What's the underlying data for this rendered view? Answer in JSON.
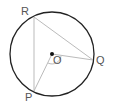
{
  "diagram": {
    "type": "circle-geometry",
    "center": {
      "label": "O",
      "x": 52,
      "y": 54
    },
    "radius": 42,
    "points": [
      {
        "label": "R",
        "x": 34,
        "y": 17
      },
      {
        "label": "Q",
        "x": 93,
        "y": 60
      },
      {
        "label": "P",
        "x": 34,
        "y": 91
      }
    ],
    "segments": [
      [
        "R",
        "Q"
      ],
      [
        "R",
        "P"
      ],
      [
        "O",
        "Q"
      ],
      [
        "O",
        "P"
      ]
    ],
    "angle_marker": {
      "at": "O",
      "between": [
        "P",
        "Q"
      ]
    },
    "colors": {
      "circle": "#222222",
      "lines": "#bbbbbb",
      "center_dot": "#111111",
      "labels": "#555555"
    }
  }
}
